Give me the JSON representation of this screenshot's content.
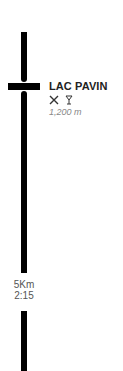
{
  "stop": {
    "name": "LAC PAVIN",
    "icons": [
      "restaurant-icon",
      "bar-icon"
    ],
    "icon_glyphs": [
      "✕",
      "Y"
    ],
    "elevation": "1,200 m"
  },
  "segment": {
    "distance": "5Km",
    "duration": "2:15"
  },
  "colors": {
    "line": "#000000",
    "elevation_text": "#888888"
  }
}
